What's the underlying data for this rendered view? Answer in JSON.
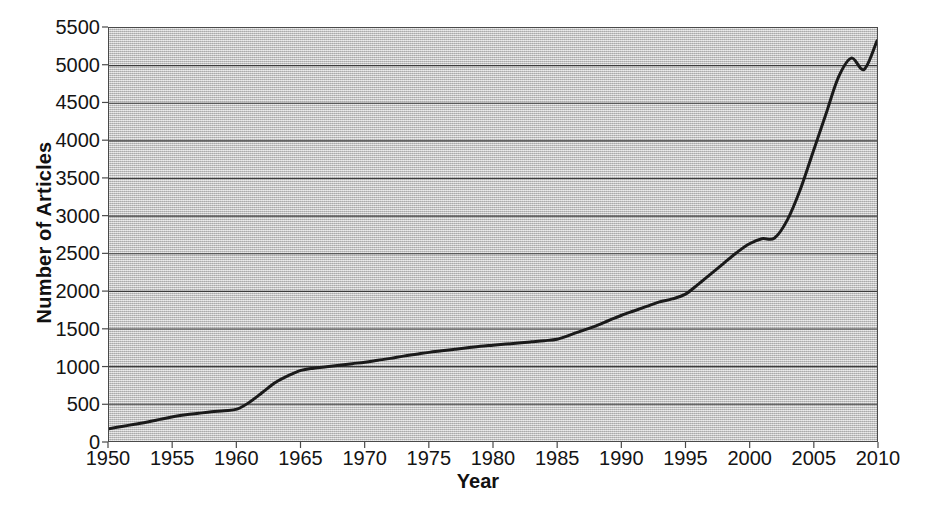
{
  "chart_data": {
    "type": "line",
    "title": "",
    "xlabel": "Year",
    "ylabel": "Number of Articles",
    "grid": true,
    "legend": "none",
    "xlim": [
      1950,
      2010
    ],
    "ylim": [
      0,
      5500
    ],
    "x_tick_labels": [
      "1950",
      "1955",
      "1960",
      "1965",
      "1970",
      "1975",
      "1980",
      "1985",
      "1990",
      "1995",
      "2000",
      "2005",
      "2010"
    ],
    "x_ticks": [
      1950,
      1955,
      1960,
      1965,
      1970,
      1975,
      1980,
      1985,
      1990,
      1995,
      2000,
      2005,
      2010
    ],
    "y_tick_labels": [
      "0",
      "500",
      "1000",
      "1500",
      "2000",
      "2500",
      "3000",
      "3500",
      "4000",
      "4500",
      "5000",
      "5500"
    ],
    "y_ticks": [
      0,
      500,
      1000,
      1500,
      2000,
      2500,
      3000,
      3500,
      4000,
      4500,
      5000,
      5500
    ],
    "series": [
      {
        "name": "Number of Articles",
        "color": "#1a1a1a",
        "line_width": 3,
        "x": [
          1950,
          1951,
          1952,
          1953,
          1954,
          1955,
          1956,
          1957,
          1958,
          1959,
          1960,
          1961,
          1962,
          1963,
          1964,
          1965,
          1966,
          1967,
          1968,
          1969,
          1970,
          1971,
          1972,
          1973,
          1974,
          1975,
          1976,
          1977,
          1978,
          1979,
          1980,
          1981,
          1982,
          1983,
          1984,
          1985,
          1986,
          1987,
          1988,
          1989,
          1990,
          1991,
          1992,
          1993,
          1994,
          1995,
          1996,
          1997,
          1998,
          1999,
          2000,
          2001,
          2002,
          2003,
          2004,
          2005,
          2006,
          2007,
          2008,
          2009,
          2010
        ],
        "y": [
          175,
          205,
          235,
          265,
          300,
          335,
          360,
          380,
          400,
          415,
          435,
          530,
          660,
          790,
          880,
          950,
          980,
          1000,
          1020,
          1040,
          1060,
          1085,
          1110,
          1140,
          1165,
          1190,
          1210,
          1230,
          1250,
          1270,
          1285,
          1300,
          1315,
          1330,
          1345,
          1365,
          1420,
          1480,
          1540,
          1610,
          1680,
          1740,
          1800,
          1860,
          1900,
          1960,
          2090,
          2230,
          2370,
          2510,
          2630,
          2700,
          2710,
          2950,
          3350,
          3850,
          4350,
          4850,
          5100,
          4950,
          5330
        ]
      }
    ]
  },
  "axes": {
    "x_axis_label": "Year",
    "y_axis_label": "Number of Articles"
  }
}
